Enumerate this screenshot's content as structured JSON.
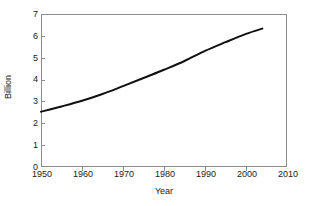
{
  "chart_data": {
    "type": "line",
    "title": "",
    "subtitle": "",
    "xlabel": "Year",
    "ylabel": "Billion",
    "xlim": [
      1950,
      2010
    ],
    "ylim": [
      0,
      7
    ],
    "xticks": [
      1950,
      1960,
      1970,
      1980,
      1990,
      2000,
      2010
    ],
    "yticks": [
      0,
      1,
      2,
      3,
      4,
      5,
      6,
      7
    ],
    "xtick_labels": [
      "1950",
      "1960",
      "1970",
      "1980",
      "1990",
      "2000",
      "2010"
    ],
    "ytick_labels": [
      "0",
      "1",
      "2",
      "3",
      "4",
      "5",
      "6",
      "7"
    ],
    "grid": false,
    "legend": false,
    "legend_position": "none",
    "series": [
      {
        "name": "World population",
        "color": "#101010",
        "line_width": 2,
        "x": [
          1950,
          1955,
          1960,
          1965,
          1970,
          1975,
          1980,
          1985,
          1990,
          1995,
          2000,
          2004
        ],
        "values": [
          2.53,
          2.77,
          3.03,
          3.34,
          3.7,
          4.07,
          4.45,
          4.85,
          5.31,
          5.71,
          6.09,
          6.33
        ]
      }
    ]
  },
  "axes": {
    "x_title": "Year",
    "y_title": "Billion"
  }
}
